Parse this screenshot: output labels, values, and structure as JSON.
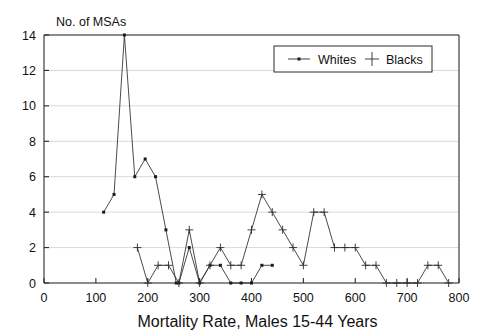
{
  "chart_data": {
    "type": "line",
    "title": "",
    "ylabel": "No. of MSAs",
    "xlabel": "Mortality Rate, Males 15-44 Years",
    "xlim": [
      0,
      800
    ],
    "ylim": [
      0,
      14
    ],
    "xticks": [
      0,
      100,
      200,
      300,
      400,
      500,
      600,
      700,
      800
    ],
    "yticks": [
      0,
      2,
      4,
      6,
      8,
      10,
      12,
      14
    ],
    "grid": true,
    "legend_position": "top-right",
    "legend": [
      "Whites",
      "Blacks"
    ],
    "series": [
      {
        "name": "Whites",
        "marker": "square-dot",
        "x": [
          115,
          135,
          155,
          175,
          195,
          215,
          235,
          255,
          260,
          280,
          300,
          320,
          340,
          360,
          380,
          400,
          420,
          440
        ],
        "y": [
          4,
          5,
          14,
          6,
          7,
          6,
          3,
          0,
          0,
          2,
          0,
          1,
          1,
          0,
          0,
          0,
          1,
          1
        ]
      },
      {
        "name": "Blacks",
        "marker": "plus",
        "x": [
          180,
          200,
          220,
          240,
          260,
          280,
          300,
          320,
          340,
          360,
          380,
          400,
          420,
          440,
          460,
          480,
          500,
          520,
          540,
          560,
          580,
          600,
          620,
          640,
          660,
          680,
          700,
          720,
          740,
          760,
          780
        ],
        "y": [
          2,
          0,
          1,
          1,
          0,
          3,
          0,
          1,
          2,
          1,
          1,
          3,
          5,
          4,
          3,
          2,
          1,
          4,
          4,
          2,
          2,
          2,
          1,
          1,
          0,
          0,
          0,
          0,
          1,
          1,
          0
        ]
      }
    ]
  },
  "axis": {
    "ylabel_text": "No. of MSAs",
    "xlabel_text": "Mortality Rate, Males 15-44 Years",
    "xtick_labels": [
      "0",
      "100",
      "200",
      "300",
      "400",
      "500",
      "600",
      "700",
      "800"
    ],
    "ytick_labels": [
      "0",
      "2",
      "4",
      "6",
      "8",
      "10",
      "12",
      "14"
    ]
  },
  "legend": {
    "items": [
      {
        "label": "Whites",
        "marker": "line-square-marker"
      },
      {
        "label": "Blacks",
        "marker": "plus-marker"
      }
    ]
  },
  "colors": {
    "ink": "#2b2b2b",
    "grid": "#c9c9c9",
    "background": "#ffffff"
  }
}
